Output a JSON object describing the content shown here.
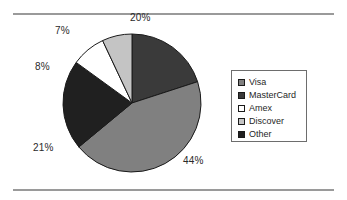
{
  "figure": {
    "background_color": "#ffffff",
    "rule_color": "#9a9a9a",
    "border_color": "#6d6d6d"
  },
  "legend": {
    "position": "right",
    "items": [
      {
        "label": "Visa",
        "color": "#808080",
        "swatch_icon": "square-swatch-icon"
      },
      {
        "label": "MasterCard",
        "color": "#3a3a3a",
        "swatch_icon": "square-swatch-icon"
      },
      {
        "label": "Amex",
        "color": "#ffffff",
        "swatch_icon": "square-swatch-icon"
      },
      {
        "label": "Discover",
        "color": "#c4c4c4",
        "swatch_icon": "square-swatch-icon"
      },
      {
        "label": "Other",
        "color": "#202020",
        "swatch_icon": "square-swatch-icon"
      }
    ]
  },
  "labels": {
    "visa": "44%",
    "mastercard": "20%",
    "amex": "8%",
    "discover": "7%",
    "other": "21%"
  },
  "chart_data": {
    "type": "pie",
    "title": "",
    "xlabel": "",
    "ylabel": "",
    "grid": false,
    "legend_position": "right",
    "labels_shown": true,
    "label_format": "percent",
    "start_angle_deg": 0,
    "direction": "clockwise",
    "categories": [
      "Visa",
      "MasterCard",
      "Amex",
      "Discover",
      "Other"
    ],
    "values": [
      44,
      20,
      8,
      7,
      21
    ],
    "value_labels": [
      "44%",
      "20%",
      "8%",
      "7%",
      "21%"
    ],
    "colors": [
      "#808080",
      "#3a3a3a",
      "#ffffff",
      "#c4c4c4",
      "#202020"
    ],
    "slices": [
      {
        "name": "MasterCard",
        "value": 20,
        "label": "20%",
        "color": "#3a3a3a",
        "start_deg": 0,
        "end_deg": 72
      },
      {
        "name": "Visa",
        "value": 44,
        "label": "44%",
        "color": "#808080",
        "start_deg": 72,
        "end_deg": 230.4
      },
      {
        "name": "Other",
        "value": 21,
        "label": "21%",
        "color": "#202020",
        "start_deg": 230.4,
        "end_deg": 306
      },
      {
        "name": "Amex",
        "value": 8,
        "label": "8%",
        "color": "#ffffff",
        "start_deg": 306,
        "end_deg": 334.8
      },
      {
        "name": "Discover",
        "value": 7,
        "label": "7%",
        "color": "#c4c4c4",
        "start_deg": 334.8,
        "end_deg": 360
      }
    ],
    "total": 100,
    "units": "percent"
  }
}
